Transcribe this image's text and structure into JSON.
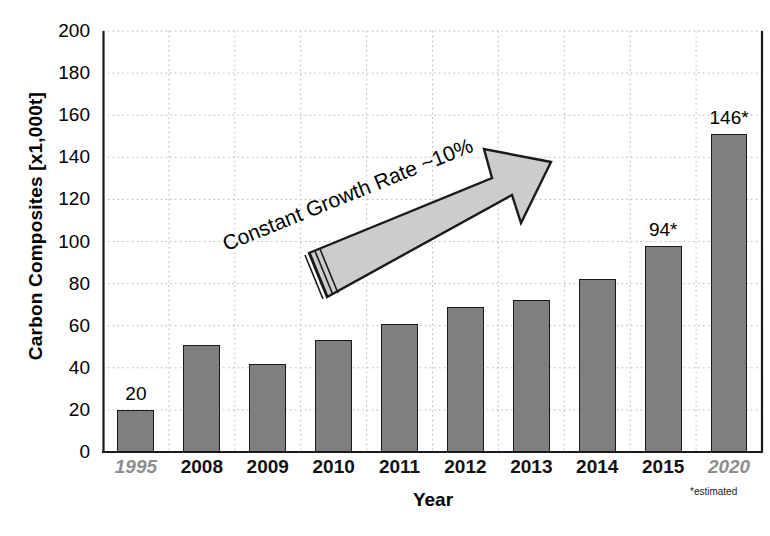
{
  "chart_data": {
    "type": "bar",
    "title": "",
    "xlabel": "Year",
    "ylabel": "Carbon Composites [x1,000t]",
    "categories": [
      "1995",
      "2008",
      "2009",
      "2010",
      "2011",
      "2012",
      "2013",
      "2014",
      "2015",
      "2020"
    ],
    "values": [
      20,
      51,
      42,
      53,
      61,
      69,
      72,
      82,
      98,
      151
    ],
    "data_labels": [
      "20",
      "",
      "",
      "",
      "",
      "",
      "",
      "",
      "94*",
      "146*"
    ],
    "ylim": [
      0,
      200
    ],
    "yticks": [
      0,
      20,
      40,
      60,
      80,
      100,
      120,
      140,
      160,
      180,
      200
    ],
    "ytick_labels": [
      "0",
      "20",
      "40",
      "60",
      "80",
      "100",
      "120",
      "140",
      "160",
      "180",
      "200"
    ],
    "grid": true,
    "legend": "none",
    "estimated_categories": [
      "1995",
      "2020"
    ],
    "annotations": [
      {
        "text": "Constant Growth Rate ~10%",
        "rotation_deg": -22
      },
      {
        "text": "*estimated"
      }
    ],
    "colors": {
      "bar_fill": "#7f7f7f",
      "bar_edge": "#1a1a1a",
      "arrow_fill": "#cccccc",
      "arrow_edge": "#1a1a1a",
      "grid": "#b9b9b9",
      "axis": "#1a1a1a",
      "dim_label": "#8d8d8d"
    }
  },
  "footnote": "*estimated",
  "annotation_text": "Constant Growth Rate ~10%"
}
